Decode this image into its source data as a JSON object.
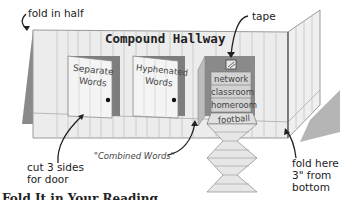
{
  "diagram": {
    "title": "Compound Hallway",
    "doors": [
      {
        "label_line1": "Separate",
        "label_line2": "Words"
      },
      {
        "label_line1": "Hyphenated",
        "label_line2": "Words"
      }
    ],
    "combined_panel": {
      "tape_label": "tape",
      "words": [
        "network",
        "classroom",
        "homeroom"
      ],
      "flap_word": "football"
    },
    "annotations": {
      "fold_in_half": "fold in half",
      "cut_door_line1": "cut 3 sides",
      "cut_door_line2": "for door",
      "combined_words": "\"Combined Words\"",
      "fold_here_line1": "fold here",
      "fold_here_line2": "3\" from",
      "fold_here_line3": "bottom"
    },
    "footer_partial": "Fold It in Your Reading"
  },
  "colors": {
    "wall": "#e9e9e9",
    "wall_lines": "#b9b9b9",
    "shadow": "#8a8a8a",
    "door_frame": "#7d7d7d",
    "combined_bg": "#cfcfcf",
    "text": "#222222"
  }
}
